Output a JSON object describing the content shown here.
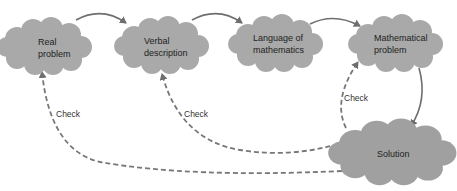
{
  "diagram": {
    "nodes": [
      {
        "id": "real-problem",
        "lines": [
          "Real",
          "problem"
        ]
      },
      {
        "id": "verbal-description",
        "lines": [
          "Verbal",
          "description"
        ]
      },
      {
        "id": "language-of-mathematics",
        "lines": [
          "Language of",
          "mathematics"
        ]
      },
      {
        "id": "mathematical-problem",
        "lines": [
          "Mathematical",
          "problem"
        ]
      },
      {
        "id": "solution",
        "lines": [
          "Solution"
        ]
      }
    ],
    "edges": [
      {
        "from": "real-problem",
        "to": "verbal-description",
        "style": "solid"
      },
      {
        "from": "verbal-description",
        "to": "language-of-mathematics",
        "style": "solid"
      },
      {
        "from": "language-of-mathematics",
        "to": "mathematical-problem",
        "style": "solid"
      },
      {
        "from": "mathematical-problem",
        "to": "solution",
        "style": "solid"
      },
      {
        "from": "solution",
        "to": "real-problem",
        "style": "dashed",
        "label": "Check"
      },
      {
        "from": "solution",
        "to": "verbal-description",
        "style": "dashed",
        "label": "Check"
      },
      {
        "from": "solution",
        "to": "mathematical-problem",
        "style": "dashed",
        "label": "Check"
      }
    ],
    "check_labels": [
      "Check",
      "Check",
      "Check"
    ],
    "colors": {
      "cloud": "#a9a9a9",
      "arrow": "#6e6e6e",
      "text": "#222222"
    }
  }
}
